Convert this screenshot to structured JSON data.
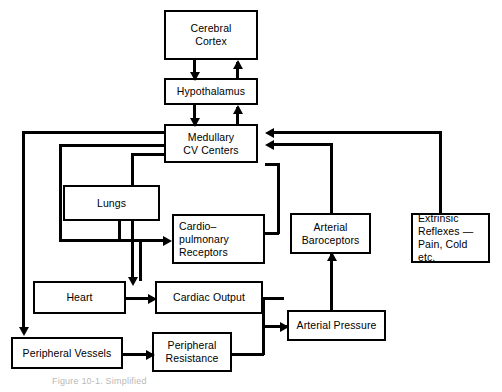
{
  "diagram": {
    "caption": "Figure 10-1.  Simplified",
    "nodes": {
      "cerebral_cortex": {
        "line1": "Cerebral",
        "line2": "Cortex"
      },
      "hypothalamus": {
        "line1": "Hypothalamus"
      },
      "medullary": {
        "line1": "Medullary",
        "line2": "CV Centers"
      },
      "lungs": {
        "line1": "Lungs"
      },
      "cardiopulmonary": {
        "line1": "Cardio–",
        "line2": "pulmonary",
        "line3": "Receptors"
      },
      "baroceptors": {
        "line1": "Arterial",
        "line2": "Baroceptors"
      },
      "extrinsic": {
        "line1": "Extrinsic",
        "line2": "Reflexes —",
        "line3": "Pain, Cold etc."
      },
      "heart": {
        "line1": "Heart"
      },
      "cardiac_output": {
        "line1": "Cardiac Output"
      },
      "arterial_pressure": {
        "line1": "Arterial Pressure"
      },
      "peripheral_vessels": {
        "line1": "Peripheral Vessels"
      },
      "peripheral_resistance": {
        "line1": "Peripheral",
        "line2": "Resistance"
      }
    },
    "colors": {
      "stroke": "#000000",
      "background": "#ffffff",
      "caption": "#b9b9b9"
    }
  }
}
